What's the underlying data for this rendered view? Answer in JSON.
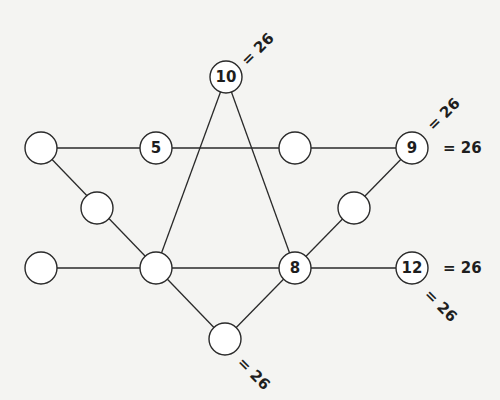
{
  "diagram": {
    "type": "magic-hexagram",
    "node_radius": 16,
    "nodes": [
      {
        "id": "n-top",
        "x": 226,
        "y": 77,
        "value": "10"
      },
      {
        "id": "n-ul-outer",
        "x": 41,
        "y": 148,
        "value": ""
      },
      {
        "id": "n-ul-inner",
        "x": 156,
        "y": 148,
        "value": "5"
      },
      {
        "id": "n-ur-inner",
        "x": 295,
        "y": 148,
        "value": ""
      },
      {
        "id": "n-ur-outer",
        "x": 412,
        "y": 148,
        "value": "9"
      },
      {
        "id": "n-left",
        "x": 97,
        "y": 208,
        "value": ""
      },
      {
        "id": "n-right",
        "x": 354,
        "y": 208,
        "value": ""
      },
      {
        "id": "n-ll-outer",
        "x": 41,
        "y": 268,
        "value": ""
      },
      {
        "id": "n-ll-inner",
        "x": 156,
        "y": 268,
        "value": ""
      },
      {
        "id": "n-lr-inner",
        "x": 295,
        "y": 268,
        "value": "8"
      },
      {
        "id": "n-lr-outer",
        "x": 412,
        "y": 268,
        "value": "12"
      },
      {
        "id": "n-bottom",
        "x": 225,
        "y": 339,
        "value": ""
      }
    ],
    "edges": [
      [
        "n-ul-outer",
        "n-ur-outer"
      ],
      [
        "n-ll-outer",
        "n-lr-outer"
      ],
      [
        "n-top",
        "n-ll-inner"
      ],
      [
        "n-top",
        "n-lr-inner"
      ],
      [
        "n-ul-outer",
        "n-bottom"
      ],
      [
        "n-ur-outer",
        "n-bottom"
      ]
    ],
    "sum_labels": [
      {
        "text": "= 26",
        "x": 244,
        "y": 63,
        "rotate": -45
      },
      {
        "text": "= 26",
        "x": 430,
        "y": 128,
        "rotate": -45
      },
      {
        "text": "= 26",
        "x": 443,
        "y": 148,
        "rotate": 0
      },
      {
        "text": "= 26",
        "x": 443,
        "y": 268,
        "rotate": 0
      },
      {
        "text": "= 26",
        "x": 427,
        "y": 292,
        "rotate": 45
      },
      {
        "text": "= 26",
        "x": 240,
        "y": 360,
        "rotate": 45
      }
    ],
    "line_sum": 26
  }
}
